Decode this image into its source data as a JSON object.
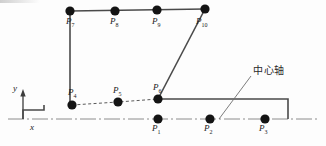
{
  "figure": {
    "title": "",
    "background_color": "#fdfdfd",
    "outline_color": "#4a4a4a",
    "node_color": "#141414",
    "centerline_color": "#8c8c8c",
    "dashed_color": "#5a5a5a",
    "leader_color": "#6e6e6e"
  },
  "axes": {
    "x_label": "x",
    "y_label": "y",
    "origin": {
      "x": 23,
      "y": 119
    }
  },
  "annotations": [
    {
      "name": "center-axis-annotation",
      "text": "中心轴",
      "x": 253,
      "y": 66,
      "leader_from": {
        "x": 219,
        "y": 119
      },
      "leader_to": {
        "x": 251,
        "y": 76
      }
    }
  ],
  "nodes": [
    {
      "id": "P1",
      "base": "P",
      "sub": "1",
      "cx": 158,
      "cy": 119,
      "r": 4.6,
      "label_x": 152,
      "label_y": 124,
      "row": "bottom"
    },
    {
      "id": "P2",
      "base": "P",
      "sub": "2",
      "cx": 210,
      "cy": 119,
      "r": 4.6,
      "label_x": 204,
      "label_y": 124,
      "row": "bottom"
    },
    {
      "id": "P3",
      "base": "P",
      "sub": "3",
      "cx": 265,
      "cy": 119,
      "r": 4.6,
      "label_x": 259,
      "label_y": 124,
      "row": "bottom"
    },
    {
      "id": "P4",
      "base": "P",
      "sub": "4",
      "cx": 72,
      "cy": 105,
      "r": 4.6,
      "label_x": 68,
      "label_y": 88,
      "row": "middle"
    },
    {
      "id": "P5",
      "base": "P",
      "sub": "5",
      "cx": 118,
      "cy": 102,
      "r": 4.6,
      "label_x": 113,
      "label_y": 86,
      "row": "middle"
    },
    {
      "id": "P6",
      "base": "P",
      "sub": "6",
      "cx": 158,
      "cy": 99,
      "r": 4.6,
      "label_x": 153,
      "label_y": 83,
      "row": "middle"
    },
    {
      "id": "P7",
      "base": "P",
      "sub": "7",
      "cx": 70,
      "cy": 11,
      "r": 4.6,
      "label_x": 66,
      "label_y": 17,
      "row": "top"
    },
    {
      "id": "P8",
      "base": "P",
      "sub": "8",
      "cx": 115,
      "cy": 11,
      "r": 4.6,
      "label_x": 110,
      "label_y": 17,
      "row": "top"
    },
    {
      "id": "P9",
      "base": "P",
      "sub": "9",
      "cx": 157,
      "cy": 10,
      "r": 4.6,
      "label_x": 152,
      "label_y": 17,
      "row": "top"
    },
    {
      "id": "P10",
      "base": "P",
      "sub": "10",
      "cx": 205,
      "cy": 9,
      "r": 4.6,
      "label_x": 196,
      "label_y": 17,
      "row": "top"
    }
  ],
  "paths": {
    "outline_solid": "M 23,119 L 23,110 L 44,110 L 44,105 L 72,105 L 158,99 L 158,99 L 205,9 L 205,9 L 70,11 L 70,105",
    "profile_step": "M 23,119 L 23,110 L 44,110 L 44,105",
    "upper_block_left": "M 70,11 L 70,105",
    "upper_block_top": "M 70,11 L 205,9",
    "upper_block_diagonal": "M 205,9 L 158,99",
    "lower_shelf": "M 158,99 L 288,99 L 288,119",
    "centerline": "M 8,119 L 318,119",
    "dashed_chain": "M 72,105 L 118,102 L 158,99",
    "y_axis": "M 23,119 L 23,92"
  },
  "stroke_widths": {
    "outline": 1.6,
    "centerline": 1.0,
    "dashed": 1.0,
    "axis": 1.3,
    "leader": 0.9
  }
}
